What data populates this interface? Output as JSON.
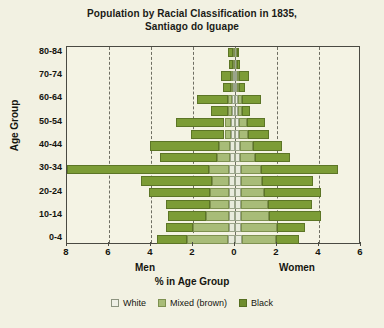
{
  "title": {
    "line1": "Population by Racial Classification in 1835,",
    "line2": "Santiago do Iguape"
  },
  "axes": {
    "ylabel": "Age Group",
    "xlabel": "% in Age Group",
    "left_side_label": "Men",
    "right_side_label": "Women"
  },
  "legend": {
    "items": [
      {
        "label": "White",
        "color": "#eff0e6",
        "key": "white"
      },
      {
        "label": "Mixed (brown)",
        "color": "#a8bc78",
        "key": "mixed"
      },
      {
        "label": "Black",
        "color": "#6f8d2e",
        "key": "black"
      }
    ]
  },
  "chart_data": {
    "type": "bar",
    "subtype": "population-pyramid-stacked",
    "title": "Population by Racial Classification in 1835, Santiago do Iguape",
    "xlabel": "% in Age Group",
    "ylabel": "Age Group",
    "left_group": "Men",
    "right_group": "Women",
    "xlim_left": 8,
    "xlim_right": 6,
    "xticks_left": [
      8,
      6,
      4,
      2,
      0
    ],
    "xticks_right": [
      2,
      4,
      6
    ],
    "xtick_labels": [
      "8",
      "6",
      "4",
      "2",
      "0",
      "2",
      "4",
      "6"
    ],
    "grid": "vertical-dashed",
    "legend_position": "bottom-center",
    "categories": [
      "0-4",
      "5-9",
      "10-14",
      "15-19",
      "20-24",
      "25-29",
      "30-34",
      "35-39",
      "40-44",
      "45-49",
      "50-54",
      "55-59",
      "60-64",
      "65-69",
      "70-74",
      "75-79",
      "80-84"
    ],
    "ytick_labels": [
      "0-4",
      "10-14",
      "20-24",
      "30-34",
      "40-44",
      "50-54",
      "60-64",
      "70-74",
      "80-84"
    ],
    "series": [
      {
        "name": "White",
        "side": "Men",
        "values": [
          0.35,
          0.3,
          0.3,
          0.3,
          0.3,
          0.3,
          0.3,
          0.25,
          0.25,
          0.2,
          0.2,
          0.15,
          0.15,
          0.1,
          0.1,
          0.05,
          0.05
        ]
      },
      {
        "name": "Mixed (brown)",
        "side": "Men",
        "values": [
          1.95,
          1.7,
          1.1,
          0.9,
          0.9,
          0.8,
          0.95,
          0.6,
          0.5,
          0.3,
          0.3,
          0.2,
          0.2,
          0.1,
          0.1,
          0.05,
          0.05
        ]
      },
      {
        "name": "Black",
        "side": "Men",
        "values": [
          1.4,
          1.3,
          1.8,
          2.1,
          2.9,
          3.4,
          6.75,
          2.7,
          3.3,
          1.6,
          2.3,
          0.8,
          1.45,
          0.35,
          0.45,
          0.2,
          0.25
        ]
      },
      {
        "name": "White",
        "side": "Women",
        "values": [
          0.35,
          0.3,
          0.3,
          0.3,
          0.3,
          0.3,
          0.3,
          0.25,
          0.25,
          0.2,
          0.2,
          0.15,
          0.15,
          0.1,
          0.1,
          0.05,
          0.05
        ]
      },
      {
        "name": "Mixed (brown)",
        "side": "Women",
        "values": [
          1.6,
          1.7,
          1.3,
          1.25,
          1.1,
          1.0,
          0.95,
          0.7,
          0.6,
          0.4,
          0.35,
          0.2,
          0.2,
          0.1,
          0.1,
          0.05,
          0.05
        ]
      },
      {
        "name": "Black",
        "side": "Women",
        "values": [
          1.1,
          1.35,
          2.5,
          2.1,
          2.7,
          2.4,
          3.65,
          1.65,
          1.4,
          1.0,
          0.9,
          0.35,
          0.9,
          0.3,
          0.45,
          0.15,
          0.1
        ]
      }
    ]
  }
}
